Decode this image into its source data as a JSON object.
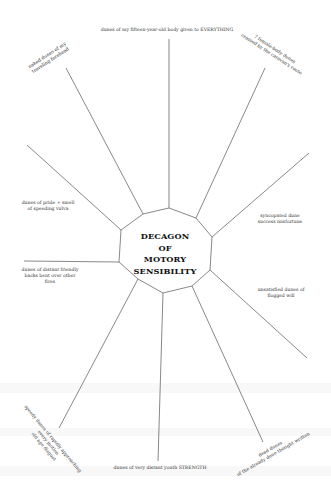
{
  "diagram": {
    "title_lines": [
      "DECAGON",
      "OF",
      "MOTORY",
      "SENSIBILITY"
    ],
    "shape": "decagon",
    "line_color": "#555555",
    "text_color": "#333333",
    "spokes": [
      {
        "label": "dunes of my fifteen-year-old body given to EVERYTHING"
      },
      {
        "label": "7 female-body dunes crossed by the caravan's route"
      },
      {
        "label": "syncopated dune success misfortune"
      },
      {
        "label": "unsatisfied dunes of flogged will"
      },
      {
        "label": "dead dunes of the already done thought written"
      },
      {
        "label": "dunes of very distant youth STRENGTH"
      },
      {
        "label": "speedy dunes of rapidly approaching old age disgust"
      },
      {
        "label": "dunes of distant friendly backs bent over other fires"
      },
      {
        "label": "dunes of pride + smell of speeding vulva"
      },
      {
        "label": "naked dunes of my traveling forehead"
      }
    ]
  },
  "labels": {
    "top": "dunes of my fifteen-year-old body given to EVERYTHING",
    "top_right_1": "7 female-body dunes",
    "top_right_2": "crossed by the caravan's route",
    "right_1": "syncopated dune",
    "right_2": "success misfortune",
    "lower_right_1": "unsatisfied dunes of",
    "lower_right_2": "flogged will",
    "bottom_right_1": "dead dunes",
    "bottom_right_2": "of the already done thought written",
    "bottom": "dunes of very distant youth STRENGTH",
    "bottom_left_1": "speedy dunes of rapidly approaching",
    "bottom_left_2": "every motion",
    "bottom_left_3": "old age disgust",
    "left_lower_1": "dunes of distant friendly",
    "left_lower_2": "backs bent over other",
    "left_lower_3": "fires",
    "left_upper_1": "dunes of pride + smell",
    "left_upper_2": "of speeding vulva",
    "top_left_1": "naked dunes of my",
    "top_left_2": "traveling forehead"
  }
}
